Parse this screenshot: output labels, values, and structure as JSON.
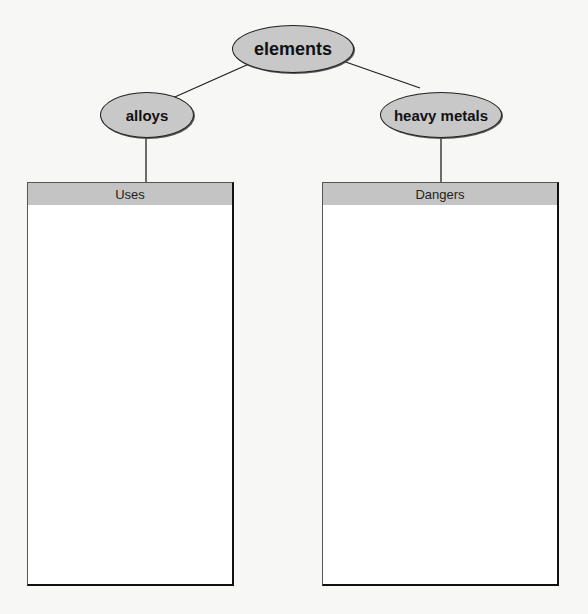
{
  "diagram": {
    "root": {
      "label": "elements"
    },
    "children": [
      {
        "label": "alloys",
        "box": {
          "header": "Uses"
        }
      },
      {
        "label": "heavy metals",
        "box": {
          "header": "Dangers"
        }
      }
    ]
  }
}
